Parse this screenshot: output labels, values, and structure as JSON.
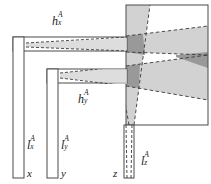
{
  "figure": {
    "type": "geometric-projection-diagram"
  },
  "colors": {
    "stroke": "#4a4a4a",
    "dashed_stroke": "#3a3a3a",
    "band_light": "#d2d2d2",
    "band_mid": "#c8c8c8",
    "overlap_dark": "#999999",
    "square_fill": "#ffffff",
    "bar_fill": "#ffffff",
    "text": "#1a1a1a",
    "background": "#ffffff"
  },
  "labels": {
    "h_x": {
      "base": "h",
      "sup": "A",
      "sub": "x"
    },
    "h_y": {
      "base": "h",
      "sup": "A",
      "sub": "y"
    },
    "l_x": {
      "base": "l",
      "sup": "A",
      "sub": "x"
    },
    "l_y": {
      "base": "l",
      "sup": "A",
      "sub": "y"
    },
    "l_z": {
      "base": "l",
      "sup": "A",
      "sub": "z"
    },
    "axis_x": "x",
    "axis_y": "y",
    "axis_z": "z"
  },
  "geometry": {
    "square": {
      "x": 126,
      "y": 5,
      "w": 82,
      "h": 120
    },
    "x_bar": {
      "x": 13,
      "y": 37,
      "w": 11,
      "h": 141
    },
    "y_bar": {
      "x": 47,
      "y": 69,
      "w": 11,
      "h": 109
    },
    "z_bar": {
      "x": 124,
      "y": 125,
      "w": 10,
      "h": 53
    },
    "x_arm": {
      "x": 13,
      "y": 37,
      "w": 114,
      "h": 14
    },
    "y_arm": {
      "x": 47,
      "y": 69,
      "w": 80,
      "h": 14
    }
  }
}
